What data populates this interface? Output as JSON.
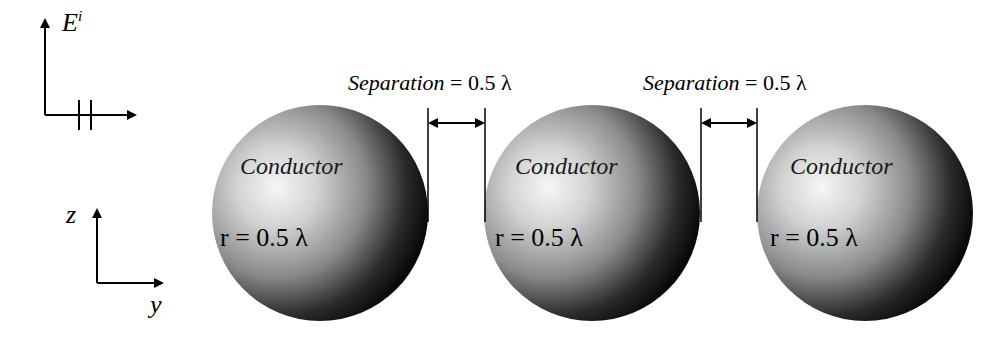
{
  "field_axes": {
    "field_symbol": "E",
    "field_superscript": "i"
  },
  "coord_axes": {
    "vertical": "z",
    "horizontal": "y"
  },
  "separations": [
    {
      "italic_label": "Separation",
      "value": " = 0.5 λ"
    },
    {
      "italic_label": "Separation",
      "value": " = 0.5 λ"
    }
  ],
  "spheres": [
    {
      "material_label": "Conductor",
      "radius_label": "r = 0.5 λ"
    },
    {
      "material_label": "Conductor",
      "radius_label": "r = 0.5 λ"
    },
    {
      "material_label": "Conductor",
      "radius_label": "r = 0.5 λ"
    }
  ],
  "colors": {
    "sphere_highlight": "#f4f4f4",
    "sphere_mid": "#a8a8a8",
    "sphere_shadow": "#000000",
    "line": "#000000"
  }
}
